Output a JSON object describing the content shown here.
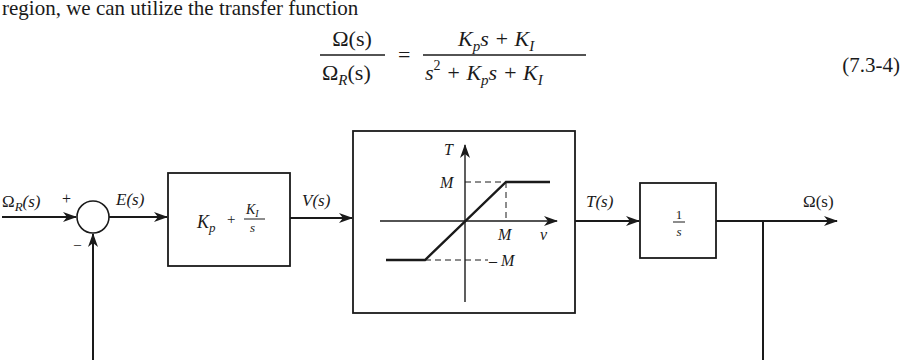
{
  "text": {
    "intro": "region, we can utilize the transfer function"
  },
  "equation": {
    "lhs_numerator": "Ω(s)",
    "lhs_denominator_base": "Ω",
    "lhs_denominator_sub": "R",
    "lhs_denominator_tail": "(s)",
    "equals": "=",
    "rhs_numerator": [
      "K",
      "p",
      "s + K",
      "I"
    ],
    "rhs_denominator": [
      "s",
      "2",
      " + K",
      "p",
      "s + K",
      "I"
    ],
    "number": "(7.3-4)"
  },
  "diagram": {
    "input_label_base": "Ω",
    "input_label_sub": "R",
    "input_label_tail": "(s)",
    "plus_sign": "+",
    "minus_sign": "–",
    "error_label": "E(s)",
    "controller": {
      "kp": "K",
      "kp_sub": "p",
      "plus": "+",
      "ki": "K",
      "ki_sub": "I",
      "s": "s"
    },
    "controller_output_label": "V(s)",
    "saturation": {
      "y_axis_label": "T",
      "x_axis_label": "v",
      "upper_level_label": "M",
      "x_break_label": "M",
      "lower_level_label": "– M"
    },
    "saturation_output_label": "T(s)",
    "integrator": {
      "numerator": "1",
      "denominator": "s"
    },
    "output_label": "Ω(s)"
  }
}
